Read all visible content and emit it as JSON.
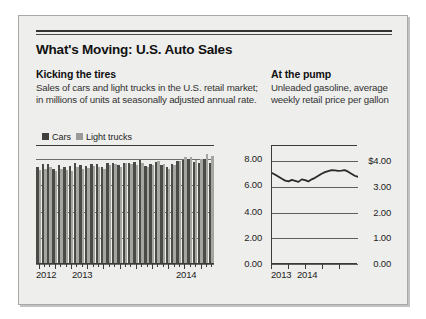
{
  "headline": "What's Moving: U.S. Auto Sales",
  "left_column": {
    "subhead": "Kicking the tires",
    "deck": "Sales of cars and light trucks in the U.S. retail market; in millions of units at seasonally adjusted annual rate."
  },
  "right_column": {
    "subhead": "At the pump",
    "deck": "Unleaded gasoline, average weekly retail price per gallon"
  },
  "colors": {
    "cars": "#4a4a47",
    "light_trucks": "#a5a5a1",
    "line": "#2b2b28",
    "panel_background": "#eeeeec",
    "axis": "#3a3a38"
  },
  "chart_data": [
    {
      "type": "bar",
      "id": "auto-sales",
      "title": "Kicking the tires",
      "xlabel": "",
      "ylabel": "",
      "ylim": [
        0,
        9
      ],
      "grid": true,
      "legend_position": "top-left",
      "ytick_labels": [
        "8.00",
        "6.00",
        "4.00",
        "2.00",
        "0.00"
      ],
      "ytick_values": [
        8,
        6,
        4,
        2,
        0
      ],
      "xtick_labels": [
        "2012",
        "2013",
        "2014"
      ],
      "categories": [
        "2012-01",
        "2012-02",
        "2012-03",
        "2012-04",
        "2012-05",
        "2012-06",
        "2012-07",
        "2012-08",
        "2012-09",
        "2012-10",
        "2012-11",
        "2012-12",
        "2013-01",
        "2013-02",
        "2013-03",
        "2013-04",
        "2013-05",
        "2013-06",
        "2013-07",
        "2013-08",
        "2013-09",
        "2013-10",
        "2013-11",
        "2013-12",
        "2014-01",
        "2014-02",
        "2014-03",
        "2014-04",
        "2014-05",
        "2014-06",
        "2014-07",
        "2014-08",
        "2014-09"
      ],
      "series": [
        {
          "name": "Cars",
          "color": "#4a4a47",
          "values": [
            7.3,
            7.55,
            7.55,
            7.2,
            7.5,
            7.35,
            7.4,
            7.65,
            7.5,
            7.4,
            7.55,
            7.55,
            7.35,
            7.6,
            7.65,
            7.5,
            7.65,
            7.6,
            7.7,
            7.85,
            7.4,
            7.55,
            7.7,
            7.45,
            7.3,
            7.55,
            7.75,
            7.85,
            7.95,
            7.7,
            7.65,
            7.95,
            7.6
          ]
        },
        {
          "name": "Light trucks",
          "color": "#a5a5a1",
          "values": [
            7.1,
            7.2,
            7.35,
            7.0,
            7.15,
            7.1,
            7.05,
            7.35,
            7.2,
            7.25,
            7.4,
            7.35,
            7.15,
            7.45,
            7.55,
            7.35,
            7.6,
            7.55,
            7.45,
            7.6,
            7.35,
            7.5,
            7.75,
            7.55,
            7.2,
            7.5,
            7.8,
            8.1,
            8.05,
            7.85,
            7.9,
            8.35,
            8.15
          ]
        }
      ]
    },
    {
      "type": "line",
      "id": "gasoline-price",
      "title": "At the pump",
      "xlabel": "",
      "ylabel": "",
      "ylim": [
        0,
        4.6
      ],
      "grid": true,
      "ytick_labels": [
        "$4.00",
        "3.00",
        "2.00",
        "1.00",
        "0.00"
      ],
      "ytick_values": [
        4,
        3,
        2,
        1,
        0
      ],
      "xtick_labels": [
        "2013",
        "2014"
      ],
      "series": [
        {
          "name": "Unleaded gasoline",
          "color": "#2b2b28",
          "values": [
            3.55,
            3.48,
            3.4,
            3.32,
            3.25,
            3.22,
            3.28,
            3.24,
            3.2,
            3.3,
            3.27,
            3.22,
            3.3,
            3.36,
            3.44,
            3.52,
            3.58,
            3.62,
            3.66,
            3.65,
            3.63,
            3.64,
            3.66,
            3.6,
            3.52,
            3.44,
            3.4
          ]
        }
      ]
    }
  ]
}
